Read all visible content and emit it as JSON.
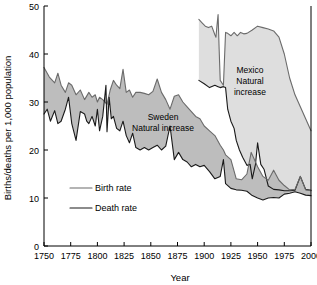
{
  "chart_data": {
    "type": "area",
    "title": "",
    "xlabel": "Year",
    "ylabel": "Births/deaths per 1,000 population",
    "xlim": [
      1750,
      2000
    ],
    "ylim": [
      0,
      50
    ],
    "xticks": [
      1750,
      1775,
      1800,
      1825,
      1850,
      1875,
      1900,
      1925,
      1950,
      1975,
      2000
    ],
    "yticks": [
      0,
      10,
      20,
      30,
      40,
      50
    ],
    "grid": false,
    "legend_position": "inner-left",
    "legend": [
      {
        "label": "Birth rate",
        "color": "#6b6b6b"
      },
      {
        "label": "Death rate",
        "color": "#1a1a1a"
      }
    ],
    "annotations": [
      {
        "text": "Sweden\nNatural increase",
        "x": 1857,
        "y": 25,
        "lines": [
          "Sweden",
          "Natural increase"
        ]
      },
      {
        "text": "Mexico\nNatural increase",
        "x": 1945,
        "y": 37,
        "lines": [
          "Mexico",
          "Natural",
          "increase"
        ]
      }
    ],
    "fills": [
      {
        "name": "Sweden Natural increase",
        "color": "#bdbdbd"
      },
      {
        "name": "Mexico Natural increase",
        "color": "#dedede"
      }
    ],
    "series": [
      {
        "name": "Sweden birth rate",
        "country": "Sweden",
        "color": "#6b6b6b",
        "x": [
          1750,
          1755,
          1760,
          1763,
          1766,
          1770,
          1773,
          1776,
          1780,
          1784,
          1788,
          1792,
          1795,
          1798,
          1800,
          1802,
          1805,
          1809,
          1812,
          1815,
          1818,
          1821,
          1824,
          1827,
          1830,
          1833,
          1836,
          1840,
          1844,
          1848,
          1852,
          1856,
          1860,
          1864,
          1868,
          1872,
          1876,
          1880,
          1884,
          1888,
          1892,
          1896,
          1900,
          1905,
          1910,
          1915,
          1918,
          1920,
          1925,
          1930,
          1935,
          1940,
          1944,
          1950,
          1955,
          1960,
          1965,
          1970,
          1975,
          1980,
          1985,
          1990,
          1995,
          2000
        ],
        "y": [
          37.2,
          35.2,
          34.0,
          36.0,
          33.5,
          32.0,
          34.0,
          33.5,
          31.5,
          32.5,
          30.5,
          32.0,
          31.0,
          31.5,
          30.0,
          31.0,
          30.5,
          29.5,
          32.5,
          34.5,
          33.5,
          32.8,
          36.8,
          32.0,
          32.5,
          31.0,
          32.0,
          32.0,
          31.8,
          31.5,
          32.2,
          34.8,
          32.0,
          30.5,
          28.5,
          31.2,
          31.5,
          30.0,
          29.0,
          28.0,
          27.0,
          26.5,
          25.0,
          24.0,
          23.0,
          21.0,
          20.0,
          19.0,
          18.0,
          14.0,
          13.8,
          15.0,
          19.5,
          16.5,
          14.5,
          13.7,
          15.8,
          13.7,
          12.6,
          11.7,
          11.8,
          14.5,
          11.7,
          11.5
        ]
      },
      {
        "name": "Sweden death rate",
        "country": "Sweden",
        "color": "#1a1a1a",
        "x": [
          1750,
          1753,
          1756,
          1760,
          1763,
          1766,
          1770,
          1773,
          1776,
          1780,
          1784,
          1788,
          1790,
          1792,
          1795,
          1798,
          1800,
          1802,
          1805,
          1808,
          1809,
          1811,
          1813,
          1815,
          1818,
          1821,
          1824,
          1827,
          1830,
          1833,
          1836,
          1840,
          1844,
          1848,
          1852,
          1856,
          1860,
          1864,
          1868,
          1872,
          1876,
          1880,
          1884,
          1888,
          1892,
          1896,
          1900,
          1905,
          1910,
          1915,
          1918,
          1920,
          1925,
          1930,
          1935,
          1940,
          1945,
          1950,
          1955,
          1960,
          1965,
          1970,
          1975,
          1980,
          1985,
          1990,
          1995,
          2000
        ],
        "y": [
          27.5,
          28.5,
          26.0,
          28.2,
          25.5,
          26.0,
          28.5,
          31.0,
          25.5,
          22.0,
          28.0,
          27.5,
          26.0,
          25.5,
          27.0,
          25.0,
          28.5,
          24.0,
          27.0,
          33.5,
          23.8,
          31.0,
          26.5,
          27.0,
          24.5,
          24.0,
          26.0,
          23.0,
          21.5,
          23.5,
          20.5,
          20.0,
          20.5,
          20.0,
          20.5,
          21.0,
          20.0,
          20.8,
          25.0,
          18.0,
          19.5,
          18.0,
          17.5,
          16.5,
          17.0,
          16.5,
          16.8,
          15.5,
          14.0,
          14.5,
          18.0,
          13.0,
          12.0,
          11.7,
          11.6,
          11.4,
          10.5,
          10.0,
          9.6,
          10.0,
          10.1,
          10.0,
          10.8,
          11.0,
          11.3,
          11.0,
          10.6,
          10.5
        ]
      },
      {
        "name": "Mexico birth rate",
        "country": "Mexico",
        "color": "#6b6b6b",
        "x": [
          1895,
          1898,
          1901,
          1904,
          1907,
          1910,
          1911,
          1912,
          1913,
          1914,
          1915,
          1918,
          1920,
          1922,
          1925,
          1928,
          1931,
          1934,
          1937,
          1940,
          1945,
          1950,
          1955,
          1960,
          1965,
          1970,
          1975,
          1980,
          1985,
          1990,
          1995,
          2000
        ],
        "y": [
          47.2,
          46.5,
          45.8,
          45.5,
          45.8,
          44.0,
          43.5,
          46.0,
          48.2,
          41.0,
          34.5,
          33.5,
          44.5,
          44.3,
          43.8,
          44.5,
          43.8,
          44.5,
          44.2,
          44.3,
          45.0,
          45.8,
          45.5,
          45.2,
          44.8,
          43.5,
          40.0,
          35.0,
          31.5,
          29.0,
          26.5,
          24.0
        ]
      },
      {
        "name": "Mexico death rate",
        "country": "Mexico",
        "color": "#1a1a1a",
        "x": [
          1895,
          1900,
          1905,
          1910,
          1913,
          1915,
          1918,
          1920,
          1922,
          1925,
          1928,
          1930,
          1933,
          1936,
          1940,
          1943,
          1945,
          1948,
          1950,
          1953,
          1956,
          1960,
          1965,
          1970,
          1975,
          1980,
          1985,
          1990,
          1995,
          2000
        ],
        "y": [
          34.5,
          33.8,
          33.0,
          33.5,
          33.2,
          33.0,
          33.2,
          33.0,
          28.5,
          26.0,
          24.5,
          22.0,
          20.0,
          18.5,
          16.8,
          17.0,
          14.0,
          17.0,
          21.5,
          17.0,
          16.0,
          12.5,
          11.8,
          11.7,
          11.5,
          11.5,
          11.6,
          14.5,
          11.8,
          11.6
        ]
      }
    ]
  },
  "axis": {
    "y_title": "Births/deaths per 1,000 population",
    "x_title": "Year",
    "y_tick_labels": [
      "50",
      "40",
      "30",
      "20",
      "10",
      "0"
    ],
    "x_tick_labels": [
      "1750",
      "1775",
      "1800",
      "1825",
      "1850",
      "1875",
      "1900",
      "1925",
      "1950",
      "1975",
      "2000"
    ]
  },
  "legend": {
    "birth_label": "Birth rate",
    "death_label": "Death rate"
  },
  "annotations": {
    "sweden_line1": "Sweden",
    "sweden_line2": "Natural increase",
    "mexico_line1": "Mexico",
    "mexico_line2": "Natural",
    "mexico_line3": "increase"
  }
}
